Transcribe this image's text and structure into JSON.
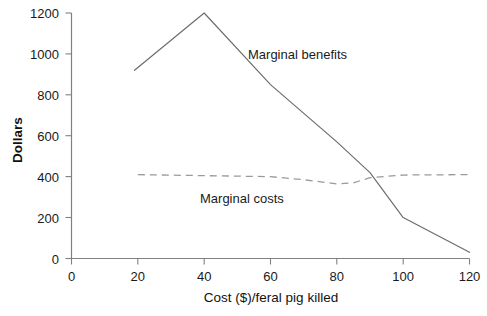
{
  "chart_data": {
    "type": "line",
    "title": "",
    "subtitle": "",
    "xlabel": "Cost ($)/feral pig killed",
    "ylabel": "Dollars",
    "xlim": [
      0,
      120
    ],
    "ylim": [
      0,
      1200
    ],
    "xticks": [
      0,
      20,
      40,
      60,
      80,
      100,
      120
    ],
    "xtick_labels": [
      "0",
      "20",
      "40",
      "60",
      "80",
      "100",
      "120"
    ],
    "yticks": [
      0,
      200,
      400,
      600,
      800,
      1000,
      1200
    ],
    "ytick_labels": [
      "0",
      "200",
      "400",
      "600",
      "800",
      "1000",
      "1200"
    ],
    "grid": false,
    "legend_position": "inline-annotations",
    "series": [
      {
        "name": "Marginal benefits",
        "style": "solid",
        "color": "#6b6b6b",
        "label_x": 62,
        "label_y": 1245,
        "x": [
          19,
          40,
          60,
          80,
          90,
          100,
          120
        ],
        "values": [
          920,
          1200,
          850,
          570,
          420,
          200,
          30
        ]
      },
      {
        "name": "Marginal costs",
        "style": "dashed",
        "color": "#9a9a9a",
        "label_x": 55,
        "label_y": 300,
        "x": [
          20,
          40,
          60,
          70,
          80,
          85,
          90,
          100,
          120
        ],
        "values": [
          410,
          405,
          400,
          385,
          365,
          370,
          395,
          408,
          410
        ]
      }
    ],
    "annotations": [
      {
        "text": "Marginal benefits",
        "x": 62,
        "y": 1245
      },
      {
        "text": "Marginal costs",
        "x": 55,
        "y": 300
      }
    ]
  },
  "axes": {
    "y_title": "Dollars",
    "x_title": "Cost ($)/feral pig killed",
    "y_labels": [
      "1200",
      "1000",
      "800",
      "600",
      "400",
      "200",
      "0"
    ],
    "x_labels": [
      "0",
      "20",
      "40",
      "60",
      "80",
      "100",
      "120"
    ],
    "x_origin_label": "0"
  },
  "series_labels": {
    "benefits": "Marginal benefits",
    "costs": "Marginal costs"
  },
  "colors": {
    "axis": "#808080",
    "benefits_line": "#6b6b6b",
    "costs_line": "#9a9a9a",
    "text": "#1a1a1a",
    "background": "#ffffff"
  }
}
